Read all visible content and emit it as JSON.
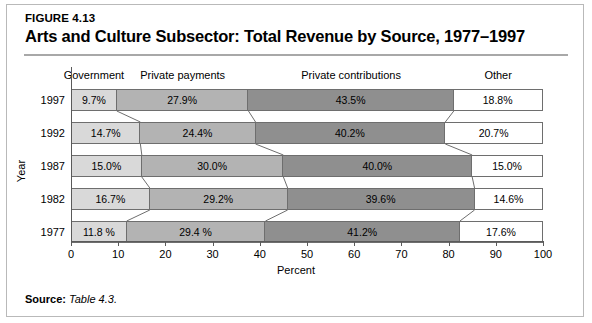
{
  "figure": {
    "number_label": "FIGURE 4.13",
    "title": "Arts and Culture Subsector: Total Revenue by Source, 1977–1997",
    "source_prefix": "Source:",
    "source_reference": "Table 4.3."
  },
  "axes": {
    "x_title": "Percent",
    "y_title": "Year",
    "x_ticks": [
      "0",
      "10",
      "20",
      "30",
      "40",
      "50",
      "60",
      "70",
      "80",
      "90",
      "100"
    ],
    "x_min": 0,
    "x_max": 100
  },
  "colors": {
    "government": "#d9d9d9",
    "private_payments": "#b3b3b3",
    "private_contributions": "#8f8f8f",
    "other": "#ffffff",
    "outline": "#6e6e6e",
    "rule": "#a8a8a8",
    "frame": "#b9b9b9"
  },
  "chart_data": {
    "type": "bar",
    "subtype": "stacked-horizontal-100-percent",
    "title": "Arts and Culture Subsector: Total Revenue by Source, 1977–1997",
    "xlabel": "Percent",
    "ylabel": "Year",
    "xlim": [
      0,
      100
    ],
    "xticks": [
      0,
      10,
      20,
      30,
      40,
      50,
      60,
      70,
      80,
      90,
      100
    ],
    "grid": false,
    "legend_position": "top-as-column-headers",
    "categories": [
      "1997",
      "1992",
      "1987",
      "1982",
      "1977"
    ],
    "series": [
      {
        "name": "Government",
        "values": [
          9.7,
          14.7,
          15.0,
          16.7,
          11.8
        ],
        "labels": [
          "9.7%",
          "14.7%",
          "15.0%",
          "16.7%",
          "11.8 %"
        ],
        "color": "#d9d9d9"
      },
      {
        "name": "Private payments",
        "values": [
          27.9,
          24.4,
          30.0,
          29.2,
          29.4
        ],
        "labels": [
          "27.9%",
          "24.4%",
          "30.0%",
          "29.2%",
          "29.4 %"
        ],
        "color": "#b3b3b3"
      },
      {
        "name": "Private contributions",
        "values": [
          43.5,
          40.2,
          40.0,
          39.6,
          41.2
        ],
        "labels": [
          "43.5%",
          "40.2%",
          "40.0%",
          "39.6%",
          "41.2%"
        ],
        "color": "#8f8f8f"
      },
      {
        "name": "Other",
        "values": [
          18.8,
          20.7,
          15.0,
          14.6,
          17.6
        ],
        "labels": [
          "18.8%",
          "20.7%",
          "15.0%",
          "14.6%",
          "17.6%"
        ],
        "color": "#ffffff"
      }
    ]
  }
}
